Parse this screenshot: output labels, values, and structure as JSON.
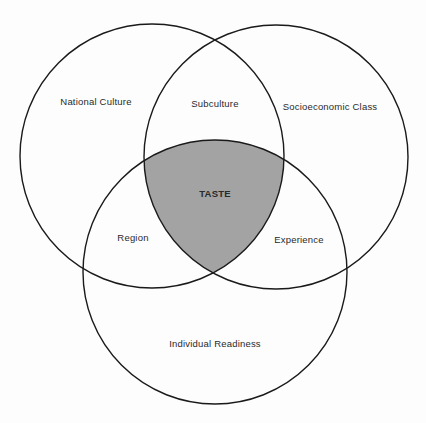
{
  "diagram": {
    "type": "venn",
    "colors": {
      "stroke": "#1a1a1a",
      "background": "#fdfdfd",
      "intersection_fill": "#a3a3a3"
    },
    "circles": [
      {
        "name": "National Culture",
        "cx": 152,
        "cy": 156,
        "r": 132
      },
      {
        "name": "Socioeconomic Class",
        "cx": 276,
        "cy": 157,
        "r": 132
      },
      {
        "name": "Individual Readiness",
        "cx": 215,
        "cy": 272,
        "r": 132
      }
    ],
    "labels": {
      "national_culture": "National Culture",
      "subculture": "Subculture",
      "socioeconomic_class": "Socioeconomic Class",
      "taste": "TASTE",
      "region": "Region",
      "experience": "Experience",
      "individual_readiness": "Individual Readiness"
    }
  }
}
